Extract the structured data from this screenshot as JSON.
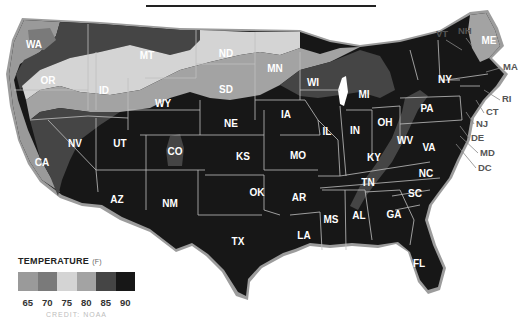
{
  "map": {
    "title": "",
    "subject": "U.S. temperature map by state",
    "states": [
      {
        "code": "WA",
        "x": 34,
        "y": 44
      },
      {
        "code": "OR",
        "x": 48,
        "y": 80
      },
      {
        "code": "ID",
        "x": 104,
        "y": 90
      },
      {
        "code": "MT",
        "x": 147,
        "y": 55
      },
      {
        "code": "ND",
        "x": 226,
        "y": 53
      },
      {
        "code": "SD",
        "x": 226,
        "y": 89
      },
      {
        "code": "MN",
        "x": 275,
        "y": 68
      },
      {
        "code": "WI",
        "x": 313,
        "y": 82
      },
      {
        "code": "MI",
        "x": 364,
        "y": 94
      },
      {
        "code": "WY",
        "x": 163,
        "y": 103
      },
      {
        "code": "NE",
        "x": 231,
        "y": 123
      },
      {
        "code": "IA",
        "x": 286,
        "y": 114
      },
      {
        "code": "IL",
        "x": 327,
        "y": 131
      },
      {
        "code": "IN",
        "x": 355,
        "y": 130
      },
      {
        "code": "OH",
        "x": 385,
        "y": 122
      },
      {
        "code": "PA",
        "x": 427,
        "y": 108
      },
      {
        "code": "NY",
        "x": 445,
        "y": 79
      },
      {
        "code": "NV",
        "x": 75,
        "y": 143
      },
      {
        "code": "UT",
        "x": 120,
        "y": 143
      },
      {
        "code": "CO",
        "x": 175,
        "y": 151
      },
      {
        "code": "KS",
        "x": 243,
        "y": 156
      },
      {
        "code": "MO",
        "x": 298,
        "y": 155
      },
      {
        "code": "KY",
        "x": 374,
        "y": 157
      },
      {
        "code": "WV",
        "x": 405,
        "y": 140
      },
      {
        "code": "VA",
        "x": 429,
        "y": 147
      },
      {
        "code": "CA",
        "x": 42,
        "y": 162
      },
      {
        "code": "AZ",
        "x": 117,
        "y": 199
      },
      {
        "code": "NM",
        "x": 170,
        "y": 203
      },
      {
        "code": "OK",
        "x": 257,
        "y": 192
      },
      {
        "code": "AR",
        "x": 299,
        "y": 197
      },
      {
        "code": "TN",
        "x": 368,
        "y": 182
      },
      {
        "code": "NC",
        "x": 426,
        "y": 173
      },
      {
        "code": "SC",
        "x": 415,
        "y": 193
      },
      {
        "code": "GA",
        "x": 394,
        "y": 214
      },
      {
        "code": "AL",
        "x": 359,
        "y": 215
      },
      {
        "code": "MS",
        "x": 331,
        "y": 219
      },
      {
        "code": "LA",
        "x": 304,
        "y": 235
      },
      {
        "code": "TX",
        "x": 238,
        "y": 241
      },
      {
        "code": "FL",
        "x": 419,
        "y": 263
      },
      {
        "code": "ME",
        "x": 489,
        "y": 40
      }
    ],
    "external_labels": [
      {
        "code": "VT",
        "x": 436,
        "y": 37
      },
      {
        "code": "NH",
        "x": 458,
        "y": 34
      },
      {
        "code": "MA",
        "x": 503,
        "y": 70
      },
      {
        "code": "RI",
        "x": 502,
        "y": 102
      },
      {
        "code": "CT",
        "x": 486,
        "y": 115
      },
      {
        "code": "NJ",
        "x": 476,
        "y": 127
      },
      {
        "code": "DE",
        "x": 471,
        "y": 141
      },
      {
        "code": "MD",
        "x": 480,
        "y": 156
      },
      {
        "code": "DC",
        "x": 478,
        "y": 171
      }
    ]
  },
  "legend": {
    "title": "TEMPERATURE",
    "unit": "(F)",
    "items": [
      {
        "label": "65",
        "color": "#9a9a9a"
      },
      {
        "label": "70",
        "color": "#7a7a7a"
      },
      {
        "label": "75",
        "color": "#d4d4d4"
      },
      {
        "label": "80",
        "color": "#a3a3a3"
      },
      {
        "label": "85",
        "color": "#454545"
      },
      {
        "label": "90",
        "color": "#171717"
      }
    ]
  },
  "credit": "CREDIT: NOAA",
  "colors": {
    "t65": "#9a9a9a",
    "t70": "#7a7a7a",
    "t75": "#d4d4d4",
    "t80": "#a3a3a3",
    "t85": "#454545",
    "t90": "#171717",
    "border": "#bfbfbf",
    "coast": "#9c9c9c"
  }
}
